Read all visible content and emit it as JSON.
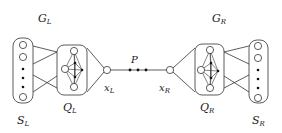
{
  "labels": {
    "GL": {
      "main": "G",
      "sub": "L"
    },
    "GR": {
      "main": "G",
      "sub": "R"
    },
    "SL": {
      "main": "S",
      "sub": "L"
    },
    "SR": {
      "main": "S",
      "sub": "R"
    },
    "QL": {
      "main": "Q",
      "sub": "L"
    },
    "QR": {
      "main": "Q",
      "sub": "R"
    },
    "xL": {
      "main": "x",
      "sub": "L"
    },
    "xR": {
      "main": "x",
      "sub": "R"
    },
    "P": "P"
  },
  "colors": {
    "stroke": "#333333",
    "fill": "#ffffff",
    "dot": "#111111"
  }
}
